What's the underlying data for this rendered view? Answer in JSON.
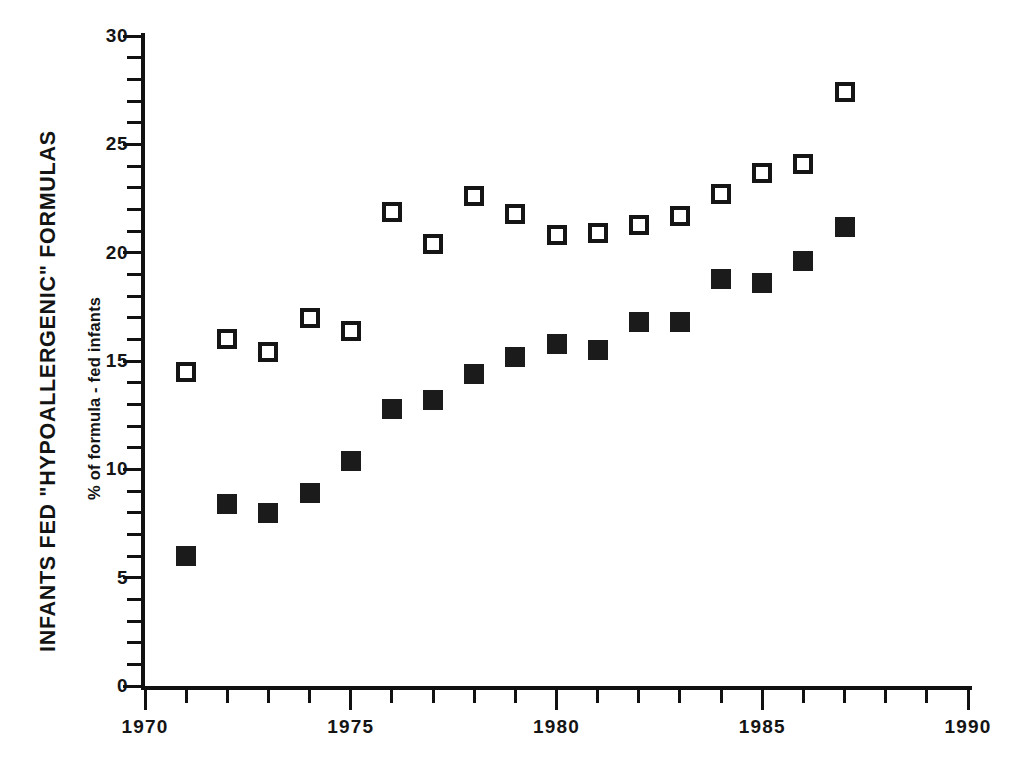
{
  "chart_data": {
    "type": "scatter",
    "title": "INFANTS FED \"HYPOALLERGENIC\" FORMULAS",
    "xlabel": "",
    "ylabel": "% of formula - fed infants",
    "xlim": [
      1970,
      1990
    ],
    "ylim": [
      0,
      30
    ],
    "grid": false,
    "legend": "none",
    "x_major_ticks": [
      1970,
      1975,
      1980,
      1985,
      1990
    ],
    "x_major_tick_labels": [
      "1970",
      "1975",
      "1980",
      "1985",
      "1990"
    ],
    "x_minor_tick_step": 1,
    "y_major_ticks": [
      0,
      5,
      10,
      15,
      20,
      25,
      30
    ],
    "y_major_tick_labels": [
      "0",
      "5",
      "10",
      "15",
      "20",
      "25",
      "30"
    ],
    "y_minor_tick_step": 1,
    "x": [
      1971,
      1972,
      1973,
      1974,
      1975,
      1976,
      1977,
      1978,
      1979,
      1980,
      1981,
      1982,
      1983,
      1984,
      1985,
      1986,
      1987
    ],
    "series": [
      {
        "name": "open-square-series",
        "marker": "open-square",
        "color": "#151515",
        "values": [
          14.5,
          16.0,
          15.4,
          17.0,
          16.4,
          21.9,
          20.4,
          22.6,
          21.8,
          20.8,
          20.9,
          21.3,
          21.7,
          22.7,
          23.7,
          24.1,
          27.4
        ]
      },
      {
        "name": "filled-square-series",
        "marker": "filled-square",
        "color": "#1b1b1b",
        "values": [
          6.0,
          8.4,
          8.0,
          8.9,
          10.4,
          12.8,
          13.2,
          14.4,
          15.2,
          15.8,
          15.5,
          16.8,
          16.8,
          18.8,
          18.6,
          19.6,
          21.2
        ]
      }
    ]
  }
}
